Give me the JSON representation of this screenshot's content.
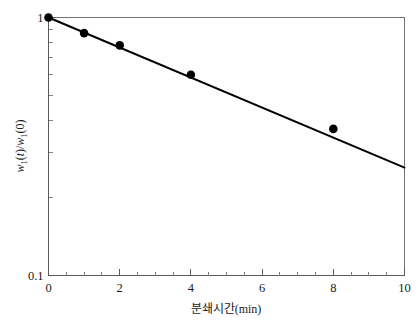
{
  "chart_data": {
    "type": "scatter",
    "title": "",
    "subtitle": "",
    "xlabel": "분쇄시간(min)",
    "ylabel": "w1(t)/w1(0)",
    "ylabel_parts": {
      "w": "w",
      "sub1": "1",
      "open_t": "(",
      "t": "t",
      "close_t": ")/",
      "w2": "w",
      "sub2": "1",
      "open_0": "(0)"
    },
    "xlim": [
      0,
      10
    ],
    "ylim": [
      0.1,
      1
    ],
    "yscale": "log",
    "xscale": "linear",
    "grid": false,
    "legend": null,
    "x_ticks_major": [
      0,
      2,
      4,
      6,
      8,
      10
    ],
    "x_tick_labels": [
      "0",
      "2",
      "4",
      "6",
      "8",
      "10"
    ],
    "x_ticks_minor": [
      0.5,
      1,
      1.5,
      2.5,
      3,
      3.5,
      4.5,
      5,
      5.5,
      6.5,
      7,
      7.5,
      8.5,
      9,
      9.5
    ],
    "y_ticks_major": [
      1,
      0.1
    ],
    "y_tick_labels": [
      "1",
      "0.1"
    ],
    "y_ticks_minor": [
      0.9,
      0.8,
      0.7,
      0.6,
      0.5,
      0.4,
      0.3,
      0.2
    ],
    "x": [
      0,
      1,
      2,
      4,
      8
    ],
    "values": [
      1.0,
      0.87,
      0.78,
      0.6,
      0.37
    ],
    "marker": "filled-circle",
    "marker_color": "#000000",
    "marker_size": 4.3,
    "fit_line": {
      "label": "exponential fit",
      "color": "#000000",
      "x_start": 0,
      "x_end": 10,
      "y_start": 1.0,
      "y_end": 0.262
    }
  },
  "figure": {
    "background_color": "#ffffff",
    "axis_color": "#555b5e",
    "frame_color": "#6d7477",
    "text_color": "#1a1a1a"
  }
}
